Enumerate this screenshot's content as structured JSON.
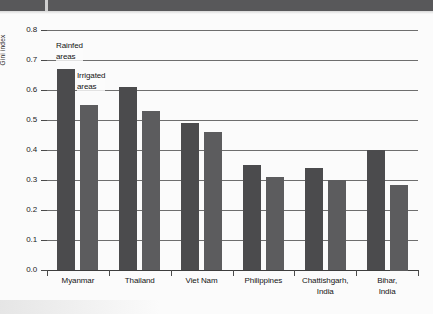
{
  "chart_data": {
    "type": "bar",
    "title": "",
    "xlabel": "",
    "ylabel": "Gini index",
    "ylim": [
      0.0,
      0.8
    ],
    "grid": true,
    "legend_position": "inline-annotation",
    "categories": [
      "Myanmar",
      "Thailand",
      "Viet Nam",
      "Philippines",
      "Chattishgarh, India",
      "Bihar, India"
    ],
    "category_lines": [
      [
        "Myanmar"
      ],
      [
        "Thailand"
      ],
      [
        "Viet Nam"
      ],
      [
        "Philippines"
      ],
      [
        "Chattishgarh,",
        "India"
      ],
      [
        "Bihar,",
        "India"
      ]
    ],
    "series": [
      {
        "name": "Rainfed areas",
        "color": "#4b4b4d",
        "values": [
          0.67,
          0.61,
          0.49,
          0.35,
          0.34,
          0.4
        ]
      },
      {
        "name": "Irrigated areas",
        "color": "#5c5c5e",
        "values": [
          0.55,
          0.53,
          0.46,
          0.31,
          0.3,
          0.285
        ]
      }
    ],
    "yticks": [
      "0.0",
      "0.1",
      "0.2",
      "0.3",
      "0.4",
      "0.5",
      "0.6",
      "0.7",
      "0.8"
    ],
    "ytick_values": [
      0.0,
      0.1,
      0.2,
      0.3,
      0.4,
      0.5,
      0.6,
      0.7,
      0.8
    ],
    "annotations": [
      {
        "text_lines": [
          "Rainfed",
          "areas"
        ],
        "target_series": "Rainfed areas",
        "target_category": "Myanmar"
      },
      {
        "text_lines": [
          "Irrigated",
          "areas"
        ],
        "target_series": "Irrigated areas",
        "target_category": "Myanmar"
      }
    ]
  },
  "figure": {
    "background_color": "#fbfbfb",
    "scan_band_color": "#58585a",
    "axis_color": "#3d3d3d",
    "gridline_color": "#6e6e6e"
  }
}
